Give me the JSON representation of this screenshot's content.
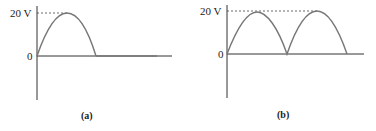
{
  "figures": [
    {
      "id": "a",
      "caption": "(a)",
      "peak_label": "20 V",
      "zero_label": "0",
      "description": "Half-wave rectified sine: one positive half-cycle then zero",
      "colors": {
        "axis": "#333333",
        "curve": "#777777",
        "dash": "#444444"
      }
    },
    {
      "id": "b",
      "caption": "(b)",
      "peak_label": "20 V",
      "zero_label": "0",
      "description": "Full-wave rectified sine: two consecutive positive half-cycles",
      "colors": {
        "axis": "#333333",
        "curve": "#777777",
        "dash": "#444444"
      }
    }
  ]
}
